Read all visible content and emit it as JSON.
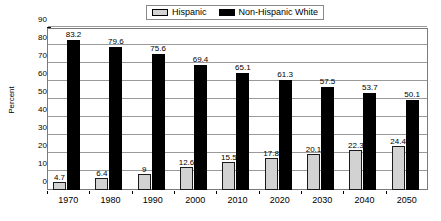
{
  "chart_data": {
    "type": "bar",
    "title": "",
    "xlabel": "",
    "ylabel": "Percent",
    "ylim": [
      0,
      90
    ],
    "ytick_step": 10,
    "grid": true,
    "legend_position": "top-center",
    "categories": [
      "1970",
      "1980",
      "1990",
      "2000",
      "2010",
      "2020",
      "2030",
      "2040",
      "2050"
    ],
    "yticks": [
      "90",
      "80",
      "70",
      "60",
      "50",
      "40",
      "30",
      "20",
      "10",
      "0"
    ],
    "series": [
      {
        "name": "Hispanic",
        "color": "#d2d2d2",
        "values": [
          4.7,
          6.4,
          9,
          12.6,
          15.5,
          17.8,
          20.1,
          22.3,
          24.4
        ],
        "labels": [
          "4.7",
          "6.4",
          "9",
          "12.6",
          "15.5",
          "17.8",
          "20.1",
          "22.3",
          "24.4"
        ]
      },
      {
        "name": "Non-Hispanic White",
        "color": "#000000",
        "values": [
          83.2,
          79.6,
          75.6,
          69.4,
          65.1,
          61.3,
          57.5,
          53.7,
          50.1
        ],
        "labels": [
          "83.2",
          "79.6",
          "75.6",
          "69.4",
          "65.1",
          "61.3",
          "57.5",
          "53.7",
          "50.1"
        ]
      }
    ]
  },
  "legend": {
    "entries": [
      {
        "label": "Hispanic",
        "swatch": "hispanic"
      },
      {
        "label": "Non-Hispanic White",
        "swatch": "nhwhite"
      }
    ]
  }
}
